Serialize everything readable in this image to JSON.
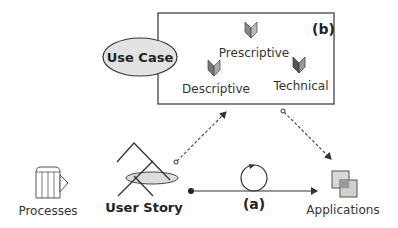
{
  "box_b": {
    "label": "(b)",
    "items": [
      {
        "label": "Prescriptive",
        "icon": "book-icon"
      },
      {
        "label": "Descriptive",
        "icon": "book-icon"
      },
      {
        "label": "Technical",
        "icon": "book-icon"
      }
    ]
  },
  "use_case": {
    "label": "Use Case"
  },
  "processes": {
    "label": "Processes",
    "icon": "process-icon"
  },
  "user_story": {
    "label": "User Story",
    "icon": "user-story-icon"
  },
  "applications": {
    "label": "Applications",
    "icon": "applications-icon"
  },
  "flow_a": {
    "label": "(a)",
    "icon": "cycle-icon"
  },
  "colors": {
    "stroke": "#333333",
    "fill_light": "#dddddd",
    "book_dark": "#555555",
    "book_light": "#999999",
    "dash": "#444444"
  }
}
